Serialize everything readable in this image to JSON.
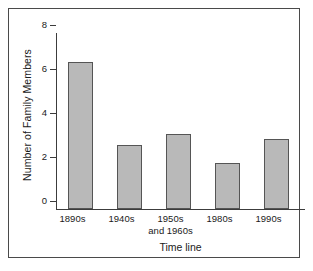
{
  "chart_data": {
    "type": "bar",
    "title": "",
    "xlabel": "Time line",
    "ylabel": "Number of Family Members",
    "categories": [
      "1890s",
      "1940s",
      "1950s\nand 1960s",
      "1980s",
      "1990s"
    ],
    "values": [
      6.7,
      2.9,
      3.4,
      2.1,
      3.2
    ],
    "ylim": [
      0,
      8
    ],
    "yticks": [
      0,
      2,
      4,
      6,
      8
    ],
    "ytick_labels": [
      "0",
      "2",
      "4",
      "6",
      "8"
    ],
    "grid": false,
    "legend": false,
    "bar_fill_color": "#b9b9b9",
    "bar_edge_color": "#555555",
    "axis_color": "#3c3c3c",
    "background_color": "#ffffff",
    "frame_color": "#4a4a4a"
  },
  "figure": {
    "frame_label": "chart-frame"
  }
}
